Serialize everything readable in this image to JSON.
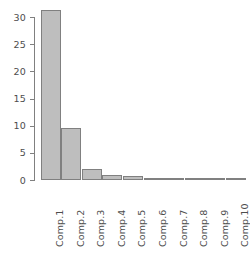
{
  "chart_data": {
    "type": "bar",
    "title": "",
    "subtitle": "",
    "xlabel": "",
    "ylabel": "",
    "categories": [
      "Comp.1",
      "Comp.2",
      "Comp.3",
      "Comp.4",
      "Comp.5",
      "Comp.6",
      "Comp.7",
      "Comp.8",
      "Comp.9",
      "Comp.10"
    ],
    "values": [
      31.4,
      9.6,
      2.2,
      1.0,
      0.75,
      0.5,
      0.45,
      0.4,
      0.3,
      0.25
    ],
    "ylim": [
      0,
      31.8
    ],
    "yticks": [
      0,
      5,
      10,
      15,
      20,
      25,
      30
    ],
    "ytick_labels": [
      "0",
      "5",
      "10",
      "15",
      "20",
      "25",
      "30"
    ],
    "grid": false,
    "legend": null,
    "legend_position": "none",
    "bar_fill_color": "#bebebe",
    "bar_border_color": "#808080",
    "axis_color": "#808080",
    "text_color": "#4d4d4d",
    "background_color": "#ffffff"
  }
}
